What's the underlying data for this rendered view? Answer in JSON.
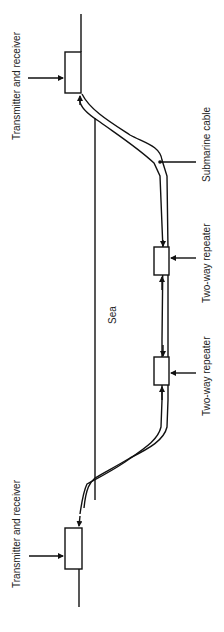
{
  "diagram": {
    "type": "submarine cable system schematic",
    "orientation": "rotated 90 degrees (labels read bottom-to-top)",
    "labels": {
      "transmitter_top": "Transmitter and receiver",
      "transmitter_bottom": "Transmitter and receiver",
      "cable": "Submarine cable",
      "repeater_1": "Two-way repeater",
      "repeater_2": "Two-way repeater",
      "sea": "Sea"
    },
    "colors": {
      "line": "#111111",
      "text": "#222222",
      "background": "#ffffff"
    }
  }
}
